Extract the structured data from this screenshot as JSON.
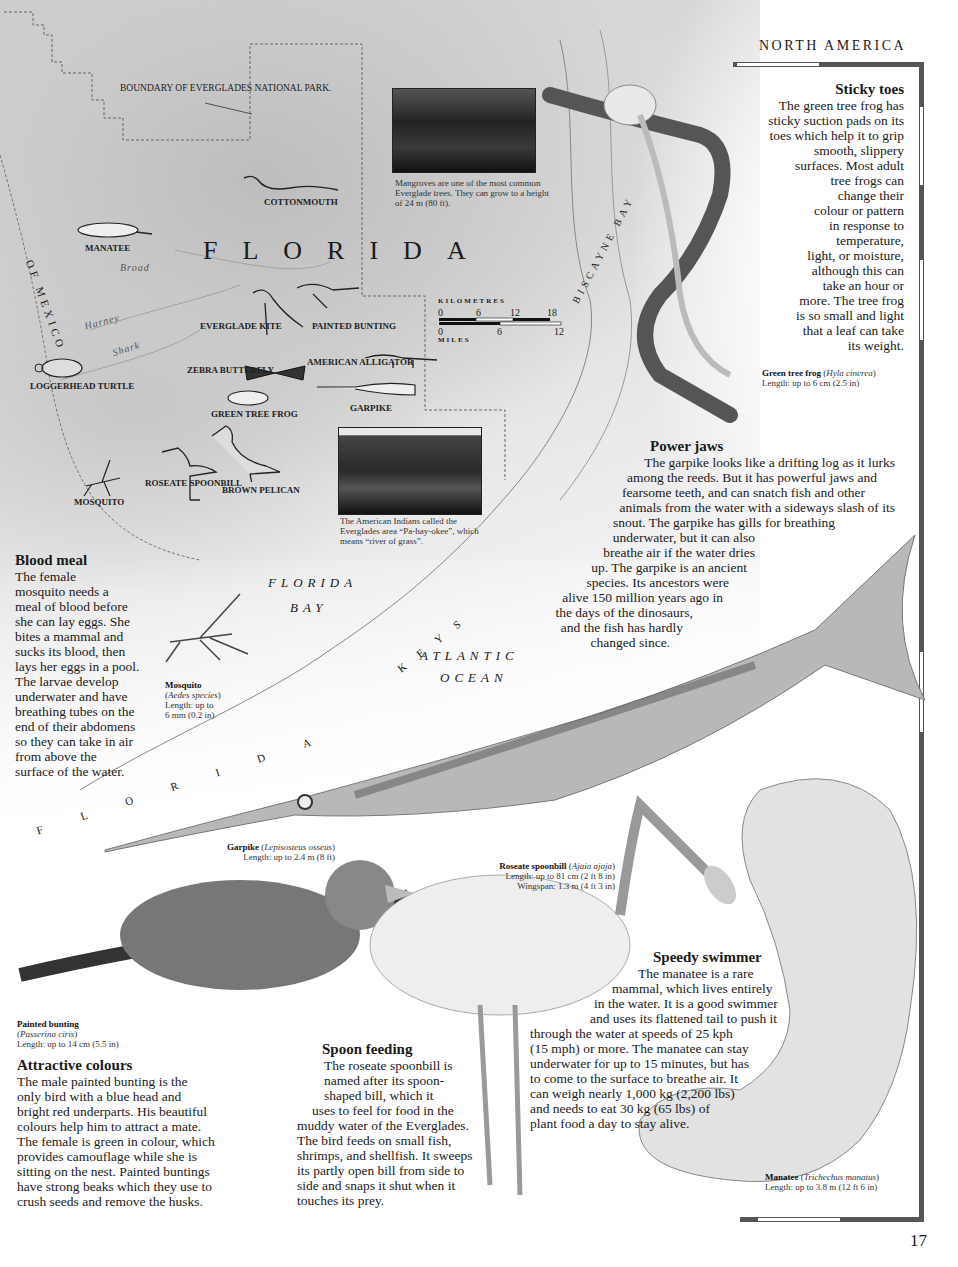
{
  "header": {
    "section_title": "NORTH AMERICA",
    "page_number": "17"
  },
  "map": {
    "title": "FLORIDA",
    "boundary_label": "BOUNDARY OF EVERGLADES NATIONAL PARK.",
    "water_labels": {
      "gulf": "OF MEXICO",
      "gulf_prefix": "E",
      "florida_bay_line1": "FLORIDA",
      "florida_bay_line2": "BAY",
      "atlantic_line1": "ATLANTIC",
      "atlantic_line2": "OCEAN",
      "biscayne_bay": "BISCAYNE BAY",
      "keys": "KEYS",
      "florida_keys_arc": "FLORIDA"
    },
    "rivers": [
      "Broad",
      "Harney",
      "Shark"
    ],
    "animal_labels": [
      {
        "id": "cottonmouth",
        "label": "Cottonmouth"
      },
      {
        "id": "manatee",
        "label": "Manatee"
      },
      {
        "id": "everglade-kite",
        "label": "Everglade kite"
      },
      {
        "id": "painted-bunting",
        "label": "Painted bunting"
      },
      {
        "id": "zebra-butterfly",
        "label": "Zebra butterfly"
      },
      {
        "id": "american-alligator",
        "label": "American alligator"
      },
      {
        "id": "loggerhead-turtle",
        "label": "Loggerhead turtle"
      },
      {
        "id": "green-tree-frog",
        "label": "Green tree frog"
      },
      {
        "id": "garpike",
        "label": "Garpike"
      },
      {
        "id": "roseate-spoonbill",
        "label": "Roseate spoonbill"
      },
      {
        "id": "brown-pelican",
        "label": "Brown pelican"
      },
      {
        "id": "mosquito",
        "label": "Mosquito"
      }
    ],
    "scale": {
      "km_label": "KILOMETRES",
      "km_ticks": [
        "0",
        "6",
        "12",
        "18"
      ],
      "miles_label": "MILES",
      "miles_ticks": [
        "0",
        "6",
        "12"
      ]
    },
    "photos": [
      {
        "id": "mangroves",
        "caption": "Mangroves are one of the most common Everglade trees. They can grow to a height of 24 m (80 ft)."
      },
      {
        "id": "everglades",
        "caption": "The American Indians called the Everglades area “Pa-hay-okee”, which means “river of grass”."
      }
    ]
  },
  "articles": {
    "sticky_toes": {
      "heading": "Sticky toes",
      "lines": [
        "The green tree frog has",
        "sticky suction pads on its",
        "toes which help it to grip",
        "smooth, slippery",
        "surfaces. Most adult",
        "tree frogs can",
        "change their",
        "colour or pattern",
        "in response to",
        "temperature,",
        "light, or moisture,",
        "although this can",
        "take an hour or",
        "more. The tree frog",
        "is so small and light",
        "that a leaf can take",
        "its weight."
      ]
    },
    "power_jaws": {
      "heading": "Power jaws",
      "lines": [
        "The garpike looks like a drifting log as it lurks",
        "among the reeds. But it has powerful jaws and",
        "fearsome teeth, and can snatch fish and other",
        "animals from the water with a sideways slash of its",
        "snout. The garpike has gills for breathing",
        "underwater, but it can also",
        "breathe air if the water dries",
        "up. The garpike is an ancient",
        "species. Its ancestors were",
        "alive 150 million years ago in",
        "the days of the dinosaurs,",
        "and the fish has hardly",
        "changed since."
      ]
    },
    "blood_meal": {
      "heading": "Blood meal",
      "lines": [
        "The female",
        "mosquito needs a",
        "meal of  blood before",
        "she can lay eggs. She",
        "bites a mammal and",
        "sucks its blood, then",
        "lays her eggs in a pool.",
        "The larvae develop",
        "underwater and have",
        "breathing tubes on the",
        "end of their abdomens",
        "so they can take in air",
        "from above the",
        "surface of the water."
      ]
    },
    "attractive_colours": {
      "heading": "Attractive colours",
      "lines": [
        "The male painted bunting is the",
        "only bird with a blue head and",
        "bright red underparts. His beautiful",
        "colours help him to attract a mate.",
        "The female is green in colour, which",
        "provides camouflage while she is",
        "sitting on the nest. Painted buntings",
        "have strong beaks which they use to",
        "crush seeds and remove the husks."
      ]
    },
    "spoon_feeding": {
      "heading": "Spoon feeding",
      "lines": [
        "The roseate spoonbill is",
        "named after its spoon-",
        "shaped bill, which it",
        "uses to feel for food in the",
        "muddy water of the Everglades.",
        "The bird feeds on  small fish,",
        "shrimps, and shellfish. It sweeps",
        "its partly open bill from side to",
        "side and snaps it shut when it",
        "touches its prey."
      ]
    },
    "speedy_swimmer": {
      "heading": "Speedy swimmer",
      "lines": [
        "The manatee is a rare",
        "mammal, which lives entirely",
        "in the water. It is a good swimmer",
        "and uses its flattened tail to push it",
        "through the water at speeds of 25 kph",
        "(15 mph) or more. The manatee can stay",
        "underwater for up to 15 minutes, but has",
        "to come to the surface to breathe air. It",
        "can weigh nearly 1,000 kg (2,200 lbs)",
        "and needs to eat 30 kg (65 lbs) of",
        "plant food a day to stay alive."
      ]
    }
  },
  "captions": {
    "frog": {
      "name": "Green tree frog",
      "latin": "Hyla cinerea",
      "length": "Length: up to 6 cm (2.5 in)"
    },
    "mosquito": {
      "name": "Mosquito",
      "latin": "Aedes species",
      "length_line1": "Length: up to",
      "length_line2": "6 mm (0.2 in)"
    },
    "garpike": {
      "name": "Garpike",
      "latin": "Lepisosteus osseus",
      "length": "Length: up to 2.4 m (8 ft)"
    },
    "spoonbill": {
      "name": "Roseate spoonbill",
      "latin": "Ajaia ajaja",
      "length": "Length: up to 81 cm (2 ft 8 in)",
      "wingspan": "Wingspan: 1.3 m  (4 ft 3 in)"
    },
    "bunting": {
      "name": "Painted bunting",
      "latin": "Passerina ciris",
      "length": "Length: up to 14 cm (5.5 in)"
    },
    "manatee": {
      "name": "Manatee",
      "latin": "Trichechus manatus",
      "length": "Length: up to 3.8 m (12 ft 6 in)"
    }
  }
}
